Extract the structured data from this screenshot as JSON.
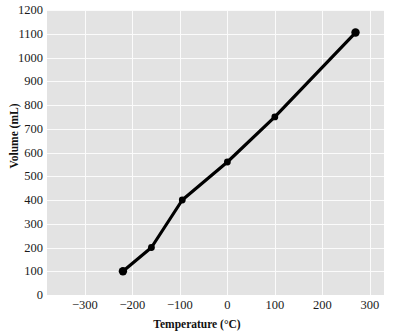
{
  "chart_data": {
    "type": "line",
    "title": "",
    "xlabel": "Temperature (°C)",
    "ylabel": "Volume (mL)",
    "xlim": [
      -380,
      330
    ],
    "ylim": [
      0,
      1200
    ],
    "grid": true,
    "legend": "none",
    "marker": "filled-circle",
    "line_color": "#000000",
    "marker_color": "#000000",
    "plot_background": "#e3e3e3",
    "gridline_color": "#fbfbfb",
    "x": [
      -220,
      -160,
      -95,
      0,
      100,
      270
    ],
    "y": [
      100,
      200,
      400,
      560,
      750,
      1105
    ],
    "points": [
      {
        "x": -220,
        "y": 100
      },
      {
        "x": -160,
        "y": 200
      },
      {
        "x": -95,
        "y": 400
      },
      {
        "x": 0,
        "y": 560
      },
      {
        "x": 100,
        "y": 750
      },
      {
        "x": 270,
        "y": 1105
      }
    ],
    "series": [
      {
        "name": "Volume vs Temperature",
        "values": [
          100,
          200,
          400,
          560,
          750,
          1105
        ]
      }
    ],
    "xticks": [
      -300,
      -200,
      -100,
      0,
      100,
      200,
      300
    ],
    "xtick_labels": [
      "−300",
      "−200",
      "−100",
      "0",
      "100",
      "200",
      "300"
    ],
    "yticks": [
      0,
      100,
      200,
      300,
      400,
      500,
      600,
      700,
      800,
      900,
      1000,
      1100,
      1200
    ],
    "ytick_labels": [
      "0",
      "100",
      "200",
      "300",
      "400",
      "500",
      "600",
      "700",
      "800",
      "900",
      "1000",
      "1100",
      "1200"
    ]
  }
}
